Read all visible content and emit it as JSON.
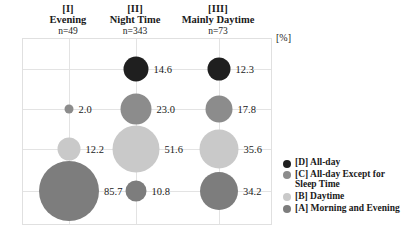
{
  "chart_data": {
    "type": "bubble",
    "title": "",
    "unit_label": "[%]",
    "categories": [
      "[I] Evening",
      "[II] Night Time",
      "[III] Mainly Daytime"
    ],
    "columns": [
      {
        "roman": "[I]",
        "name": "Evening",
        "n": "n=49"
      },
      {
        "roman": "[II]",
        "name": "Night Time",
        "n": "n=343"
      },
      {
        "roman": "[III]",
        "name": "Mainly Daytime",
        "n": "n=73"
      }
    ],
    "rows": [
      {
        "key": "D",
        "label": "[D] All-day",
        "color": "#1f1f1f"
      },
      {
        "key": "C",
        "label": "[C] All-day Except for Sleep Time",
        "color": "#8c8c8c"
      },
      {
        "key": "B",
        "label": "[B] Daytime",
        "color": "#c9c9c9"
      },
      {
        "key": "A",
        "label": "[A] Morning and Evening",
        "color": "#7d7d7d"
      }
    ],
    "series": [
      {
        "name": "[D] All-day",
        "values": [
          null,
          14.6,
          12.3
        ]
      },
      {
        "name": "[C] All-day Except for Sleep Time",
        "values": [
          2.0,
          23.0,
          17.8
        ]
      },
      {
        "name": "[B] Daytime",
        "values": [
          12.2,
          51.6,
          35.6
        ]
      },
      {
        "name": "[A] Morning and Evening",
        "values": [
          85.7,
          10.8,
          34.2
        ]
      }
    ],
    "points": [
      {
        "row": 0,
        "col": 0,
        "value": null,
        "label": "",
        "color": "#1f1f1f",
        "radius": 0
      },
      {
        "row": 0,
        "col": 1,
        "value": 14.6,
        "label": "14.6",
        "color": "#1f1f1f",
        "radius": 12.5
      },
      {
        "row": 0,
        "col": 2,
        "value": 12.3,
        "label": "12.3",
        "color": "#1f1f1f",
        "radius": 11.5
      },
      {
        "row": 1,
        "col": 0,
        "value": 2.0,
        "label": "2.0",
        "color": "#8c8c8c",
        "radius": 4.5
      },
      {
        "row": 1,
        "col": 1,
        "value": 23.0,
        "label": "23.0",
        "color": "#8c8c8c",
        "radius": 15.5
      },
      {
        "row": 1,
        "col": 2,
        "value": 17.8,
        "label": "17.8",
        "color": "#8c8c8c",
        "radius": 13.5
      },
      {
        "row": 2,
        "col": 0,
        "value": 12.2,
        "label": "12.2",
        "color": "#c9c9c9",
        "radius": 11.5
      },
      {
        "row": 2,
        "col": 1,
        "value": 51.6,
        "label": "51.6",
        "color": "#c9c9c9",
        "radius": 23.5
      },
      {
        "row": 2,
        "col": 2,
        "value": 35.6,
        "label": "35.6",
        "color": "#c9c9c9",
        "radius": 19.5
      },
      {
        "row": 3,
        "col": 0,
        "value": 85.7,
        "label": "85.7",
        "color": "#7d7d7d",
        "radius": 30.0
      },
      {
        "row": 3,
        "col": 1,
        "value": 10.8,
        "label": "10.8",
        "color": "#7d7d7d",
        "radius": 10.5
      },
      {
        "row": 3,
        "col": 2,
        "value": 34.2,
        "label": "34.2",
        "color": "#7d7d7d",
        "radius": 19.0
      }
    ],
    "grid": true,
    "legend_position": "right"
  },
  "legend": {
    "items": [
      {
        "label": "[D] All-day",
        "color": "#1f1f1f"
      },
      {
        "label": "[C] All-day Except for\n     Sleep Time",
        "color": "#8c8c8c"
      },
      {
        "label": "[B] Daytime",
        "color": "#c9c9c9"
      },
      {
        "label": "[A] Morning and Evening",
        "color": "#7d7d7d"
      }
    ]
  }
}
